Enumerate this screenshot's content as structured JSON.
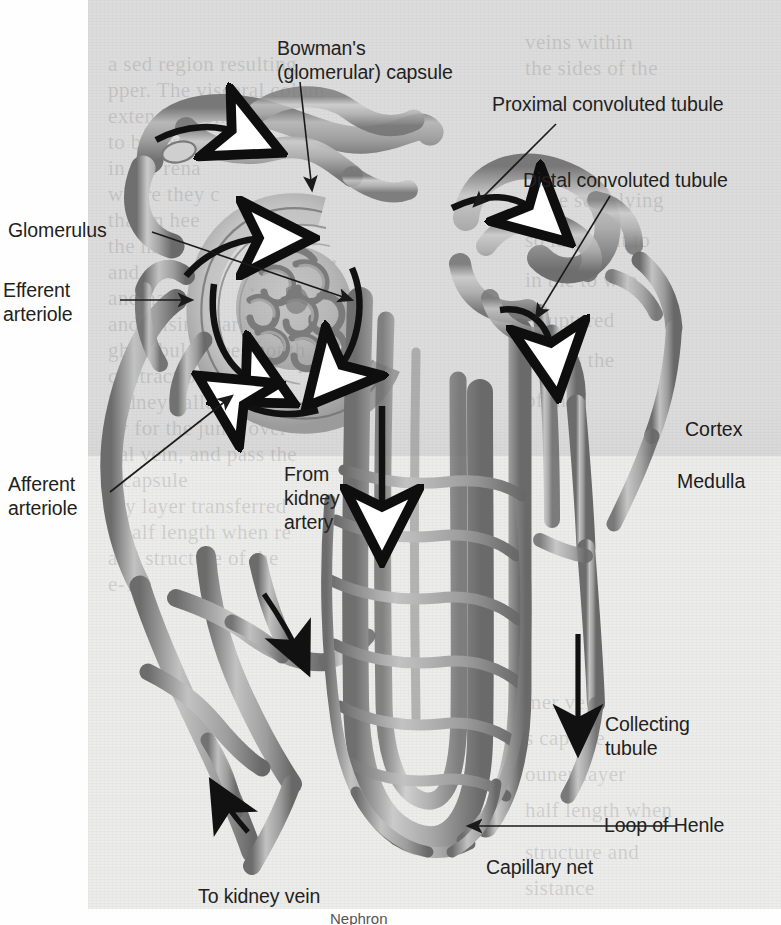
{
  "figure": {
    "title": "Nephron",
    "caption_partial": "Nephron",
    "regions": [
      {
        "id": "cortex",
        "label": "Cortex",
        "tone": "#dedede"
      },
      {
        "id": "medulla",
        "label": "Medulla",
        "tone": "#ececeb"
      }
    ]
  },
  "labels": {
    "bowmans_capsule": "Bowman's\n(glomerular) capsule",
    "proximal_convoluted_tubule": "Proximal convoluted tubule",
    "distal_convoluted_tubule": "Distal convoluted tubule",
    "glomerulus": "Glomerulus",
    "efferent_arteriole": "Efferent\narteriole",
    "afferent_arteriole": "Afferent\narteriole",
    "from_kidney_artery": "From\nkidney\nartery",
    "cortex": "Cortex",
    "medulla": "Medulla",
    "collecting_tubule": "Collecting\ntubule",
    "loop_of_henle": "Loop of Henle",
    "capillary_net": "Capillary net",
    "to_kidney_vein": "To kidney vein"
  },
  "ghost_text": [
    {
      "text": "a sed region resulting",
      "x": 108,
      "y": 52
    },
    {
      "text": "pper. The visceral colum",
      "x": 108,
      "y": 78
    },
    {
      "text": "extend beyond the",
      "x": 108,
      "y": 104
    },
    {
      "text": "to be extremel",
      "x": 108,
      "y": 130
    },
    {
      "text": "in the rena",
      "x": 108,
      "y": 156
    },
    {
      "text": "where they c",
      "x": 108,
      "y": 182
    },
    {
      "text": "that in hee",
      "x": 108,
      "y": 208
    },
    {
      "text": "the hro",
      "x": 108,
      "y": 234
    },
    {
      "text": "and out of",
      "x": 108,
      "y": 260
    },
    {
      "text": "and has not",
      "x": 108,
      "y": 286
    },
    {
      "text": "and arising var",
      "x": 108,
      "y": 312
    },
    {
      "text": "gh, tubular does not th",
      "x": 108,
      "y": 338
    },
    {
      "text": "contraction along",
      "x": 108,
      "y": 364
    },
    {
      "text": "kidney called the",
      "x": 108,
      "y": 390
    },
    {
      "text": "ey for the jump over",
      "x": 108,
      "y": 416
    },
    {
      "text": "nal vein, and pass the",
      "x": 108,
      "y": 442
    },
    {
      "text": "s capsule",
      "x": 108,
      "y": 468
    },
    {
      "text": "ary layer transferred",
      "x": 108,
      "y": 494
    },
    {
      "text": "f half length when re",
      "x": 108,
      "y": 520
    },
    {
      "text": "and structure of the",
      "x": 108,
      "y": 546
    },
    {
      "text": "e-19.",
      "x": 108,
      "y": 572
    },
    {
      "text": "veins within",
      "x": 525,
      "y": 30
    },
    {
      "text": "the sides of the",
      "x": 525,
      "y": 56
    },
    {
      "text": "to be seen lying",
      "x": 525,
      "y": 188
    },
    {
      "text": "so large but to",
      "x": 525,
      "y": 228
    },
    {
      "text": "in the to wea",
      "x": 525,
      "y": 268
    },
    {
      "text": "e ruptured",
      "x": 525,
      "y": 308
    },
    {
      "text": "ntae is the",
      "x": 525,
      "y": 348
    },
    {
      "text": "of the",
      "x": 525,
      "y": 388
    },
    {
      "text": "mer vein",
      "x": 525,
      "y": 690
    },
    {
      "text": "s capsule",
      "x": 525,
      "y": 726
    },
    {
      "text": "ouner-layer",
      "x": 525,
      "y": 762
    },
    {
      "text": "half length when",
      "x": 525,
      "y": 798
    },
    {
      "text": "structure and",
      "x": 525,
      "y": 840
    },
    {
      "text": "sistance",
      "x": 525,
      "y": 876
    }
  ],
  "colors": {
    "tube_light": "#b8b8b8",
    "tube_mid": "#9a9a9a",
    "tube_dark": "#6f6f6f",
    "vessel": "#8e8e8e",
    "arrow": "#111111",
    "text": "#231f20"
  },
  "structures": [
    {
      "name": "glomerulus",
      "kind": "capillary-tuft"
    },
    {
      "name": "bowmans-capsule",
      "kind": "cup"
    },
    {
      "name": "proximal-convoluted-tubule",
      "kind": "coiled-tube"
    },
    {
      "name": "distal-convoluted-tubule",
      "kind": "coiled-tube"
    },
    {
      "name": "loop-of-henle",
      "kind": "hairpin-tube"
    },
    {
      "name": "collecting-tubule",
      "kind": "straight-tube"
    },
    {
      "name": "afferent-arteriole",
      "kind": "vessel"
    },
    {
      "name": "efferent-arteriole",
      "kind": "vessel"
    },
    {
      "name": "capillary-net",
      "kind": "vessel-network"
    }
  ]
}
